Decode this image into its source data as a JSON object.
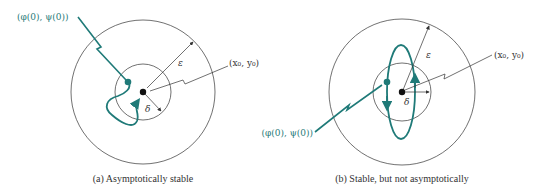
{
  "colors": {
    "trajectory": "#1f7a78",
    "line": "#333333",
    "background": "#ffffff"
  },
  "panels": [
    {
      "id": "a",
      "caption": "(a) Asymptotically stable",
      "initial_point_label": "(φ(0), ψ(0))",
      "equilibrium_label": "(x₀, y₀)",
      "epsilon_label": "ε",
      "delta_label": "δ"
    },
    {
      "id": "b",
      "caption": "(b) Stable, but not asymptotically",
      "initial_point_label": "(φ(0), ψ(0))",
      "equilibrium_label": "(x₀, y₀)",
      "epsilon_label": "ε",
      "delta_label": "δ"
    }
  ]
}
